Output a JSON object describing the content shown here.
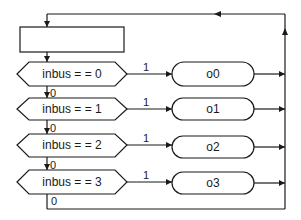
{
  "diagram": {
    "type": "flowchart",
    "start_block": {
      "label": ""
    },
    "decisions": [
      {
        "label": "inbus  = = 0",
        "true_label": "1",
        "false_label": "0",
        "output": "o0"
      },
      {
        "label": "inbus  = = 1",
        "true_label": "1",
        "false_label": "0",
        "output": "o1"
      },
      {
        "label": "inbus  = =  2",
        "true_label": "1",
        "false_label": "0",
        "output": "o2"
      },
      {
        "label": "inbus  = = 3",
        "true_label": "1",
        "false_label": "0",
        "output": "o3"
      }
    ],
    "outputs": [
      {
        "label": "o0"
      },
      {
        "label": "o1"
      },
      {
        "label": "o2"
      },
      {
        "label": "o3"
      }
    ],
    "colors": {
      "line": "#1a1a1a",
      "background": "#ffffff"
    }
  }
}
